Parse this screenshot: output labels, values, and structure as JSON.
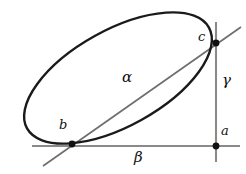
{
  "figure": {
    "title": "",
    "type": "geometry-diagram",
    "width": 246,
    "height": 174,
    "background": "#ffffff"
  },
  "colors": {
    "ellipse_stroke": "#1a1a1a",
    "axis_stroke": "#808080",
    "diagonal_stroke": "#5a5a5a",
    "point_fill": "#111111",
    "label_color": "#111111"
  },
  "labels": {
    "point_a": "a",
    "point_b": "b",
    "point_c": "c",
    "segment_alpha": "α",
    "segment_beta": "β",
    "segment_gamma": "γ"
  },
  "geometry": {
    "ellipse": {
      "center_x": 118,
      "center_y": 78,
      "radius_major": 104,
      "radius_minor": 48,
      "rotation_deg": -29
    },
    "points": [
      {
        "name": "a",
        "x": 216,
        "y": 146
      },
      {
        "name": "b",
        "x": 72,
        "y": 144
      },
      {
        "name": "c",
        "x": 216,
        "y": 43
      }
    ],
    "lines": [
      {
        "name": "horizontal-beta",
        "x1": 32,
        "y1": 146,
        "x2": 240,
        "y2": 146
      },
      {
        "name": "vertical-gamma",
        "x1": 216,
        "y1": 22,
        "x2": 216,
        "y2": 162
      },
      {
        "name": "diagonal-alpha",
        "x1": 43,
        "y1": 166,
        "x2": 241,
        "y2": 27
      }
    ],
    "label_positions": {
      "a": {
        "x": 221,
        "y": 124
      },
      "b": {
        "x": 59,
        "y": 118
      },
      "c": {
        "x": 198,
        "y": 30
      },
      "alpha": {
        "x": 122,
        "y": 70
      },
      "beta": {
        "x": 134,
        "y": 150
      },
      "gamma": {
        "x": 222,
        "y": 73
      }
    }
  }
}
